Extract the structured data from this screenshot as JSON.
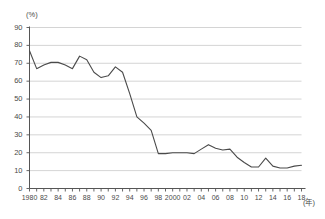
{
  "chart_data": {
    "type": "line",
    "title": "",
    "subtitle": "",
    "xlabel": "(年)",
    "ylabel": "(%)",
    "ylim": [
      0,
      90
    ],
    "xlim": [
      1980,
      2018
    ],
    "grid": true,
    "legend_position": "none",
    "y_ticks": [
      0,
      10,
      20,
      30,
      40,
      50,
      60,
      70,
      80,
      90
    ],
    "y_tick_labels": [
      "0",
      "10",
      "20",
      "30",
      "40",
      "50",
      "60",
      "70",
      "80",
      "90"
    ],
    "x_ticks": [
      1980,
      1981,
      1982,
      1983,
      1984,
      1985,
      1986,
      1987,
      1988,
      1989,
      1990,
      1991,
      1992,
      1993,
      1994,
      1995,
      1996,
      1997,
      1998,
      1999,
      2000,
      2001,
      2002,
      2003,
      2004,
      2005,
      2006,
      2007,
      2008,
      2009,
      2010,
      2011,
      2012,
      2013,
      2014,
      2015,
      2016,
      2017,
      2018
    ],
    "x_tick_labels": [
      "1980",
      "",
      "82",
      "",
      "84",
      "",
      "86",
      "",
      "88",
      "",
      "90",
      "",
      "92",
      "",
      "94",
      "",
      "96",
      "",
      "98",
      "",
      "2000",
      "",
      "02",
      "",
      "04",
      "",
      "06",
      "",
      "08",
      "",
      "10",
      "",
      "12",
      "",
      "14",
      "",
      "16",
      "",
      "18"
    ],
    "x": [
      1980,
      1981,
      1982,
      1983,
      1984,
      1985,
      1986,
      1987,
      1988,
      1989,
      1990,
      1991,
      1992,
      1993,
      1994,
      1995,
      1996,
      1997,
      1998,
      1999,
      2000,
      2001,
      2002,
      2003,
      2004,
      2005,
      2006,
      2007,
      2008,
      2009,
      2010,
      2011,
      2012,
      2013,
      2014,
      2015,
      2016,
      2017,
      2018
    ],
    "values": [
      77,
      67,
      69,
      70.5,
      70.5,
      69,
      67,
      74,
      72,
      65,
      62,
      63,
      68,
      65,
      53,
      40,
      36.5,
      32.5,
      19.5,
      19.5,
      20,
      20,
      20,
      19.5,
      22,
      24.5,
      22.5,
      21.5,
      22,
      17.5,
      14.5,
      12,
      12,
      17,
      12.5,
      11.5,
      11.5,
      12.5,
      13
    ],
    "series": [
      {
        "name": "",
        "color": "#4a4a4a",
        "values": [
          77,
          67,
          69,
          70.5,
          70.5,
          69,
          67,
          74,
          72,
          65,
          62,
          63,
          68,
          65,
          53,
          40,
          36.5,
          32.5,
          19.5,
          19.5,
          20,
          20,
          20,
          19.5,
          22,
          24.5,
          22.5,
          21.5,
          22,
          17.5,
          14.5,
          12,
          12,
          17,
          12.5,
          11.5,
          11.5,
          12.5,
          13
        ]
      }
    ],
    "annotations": []
  },
  "axes": {
    "y_unit": "(%)",
    "x_unit": "(年)"
  },
  "colors": {
    "line": "#4a4a4a",
    "grid": "#c9c9c9",
    "axis": "#555555",
    "background": "#ffffff"
  }
}
